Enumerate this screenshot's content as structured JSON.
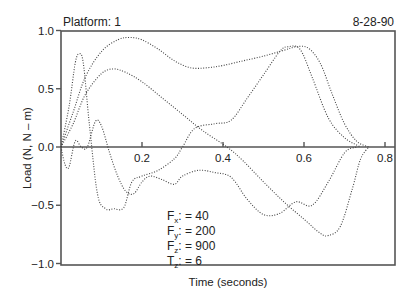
{
  "header": {
    "platform_label": "Platform: 1",
    "date": "8-28-90"
  },
  "annotation": [
    {
      "sym": "F",
      "sub": "x",
      "text": ": = 40"
    },
    {
      "sym": "F",
      "sub": "y",
      "text": ": = 200"
    },
    {
      "sym": "F",
      "sub": "z",
      "text": ": = 900"
    },
    {
      "sym": "T",
      "sub": "z",
      "text": ": = 6"
    }
  ],
  "chart_data": {
    "type": "line",
    "title": "Platform: 1",
    "subtitle": "8-28-90",
    "xlabel": "Time (seconds)",
    "ylabel": "Load (N, N – m)",
    "xlim": [
      0,
      0.82
    ],
    "ylim": [
      -1.0,
      1.0
    ],
    "xticks": [
      0.2,
      0.4,
      0.6,
      0.8
    ],
    "xtick_labels": [
      "0.2",
      "0.4",
      "0.6",
      "0.8"
    ],
    "yticks": [
      1.0,
      0.5,
      0.0,
      -0.5,
      -1.0
    ],
    "ytick_labels": [
      "1.0",
      "0.5",
      "0.0",
      "−0.5",
      "−1.0"
    ],
    "grid": false,
    "line_style": "dotted",
    "legend_position": "inside-lower-center (scale factors)",
    "series": [
      {
        "name": "Fz (scale 900)",
        "x": [
          0.0,
          0.03,
          0.06,
          0.1,
          0.14,
          0.17,
          0.2,
          0.24,
          0.28,
          0.32,
          0.36,
          0.4,
          0.45,
          0.5,
          0.55,
          0.58,
          0.61,
          0.64,
          0.67,
          0.7,
          0.73,
          0.76
        ],
        "y": [
          0.0,
          0.3,
          0.6,
          0.82,
          0.92,
          0.94,
          0.92,
          0.84,
          0.74,
          0.68,
          0.68,
          0.7,
          0.74,
          0.78,
          0.83,
          0.86,
          0.85,
          0.72,
          0.45,
          0.2,
          0.05,
          0.0
        ]
      },
      {
        "name": "Fy (scale 200)",
        "x": [
          0.0,
          0.03,
          0.06,
          0.1,
          0.13,
          0.16,
          0.2,
          0.25,
          0.3,
          0.35,
          0.41,
          0.45,
          0.5,
          0.55,
          0.6,
          0.64,
          0.66,
          0.69,
          0.72,
          0.74,
          0.76
        ],
        "y": [
          0.0,
          0.2,
          0.45,
          0.63,
          0.67,
          0.64,
          0.56,
          0.42,
          0.28,
          0.14,
          0.0,
          -0.12,
          -0.3,
          -0.47,
          -0.62,
          -0.74,
          -0.76,
          -0.68,
          -0.35,
          -0.1,
          0.0
        ]
      },
      {
        "name": "Fx (scale 40)",
        "x": [
          0.0,
          0.02,
          0.035,
          0.045,
          0.055,
          0.07,
          0.09,
          0.11,
          0.13,
          0.155,
          0.175,
          0.2,
          0.24,
          0.28,
          0.3,
          0.33,
          0.38,
          0.42,
          0.46,
          0.5,
          0.54,
          0.56,
          0.59,
          0.62,
          0.66,
          0.7,
          0.74
        ],
        "y": [
          0.0,
          0.35,
          0.72,
          0.8,
          0.72,
          0.2,
          -0.4,
          -0.53,
          -0.53,
          -0.52,
          -0.3,
          -0.25,
          -0.2,
          -0.1,
          0.0,
          0.16,
          0.2,
          0.23,
          0.42,
          0.62,
          0.82,
          0.86,
          0.84,
          0.6,
          0.25,
          0.08,
          0.0
        ]
      },
      {
        "name": "Tz (scale 6)",
        "x": [
          0.0,
          0.01,
          0.02,
          0.035,
          0.05,
          0.065,
          0.085,
          0.1,
          0.12,
          0.14,
          0.16,
          0.18,
          0.2,
          0.22,
          0.25,
          0.28,
          0.3,
          0.34,
          0.38,
          0.42,
          0.46,
          0.5,
          0.54,
          0.58,
          0.62,
          0.66,
          0.7,
          0.73
        ],
        "y": [
          0.0,
          -0.15,
          -0.17,
          0.05,
          0.0,
          0.0,
          0.22,
          0.18,
          -0.05,
          -0.25,
          -0.38,
          -0.4,
          -0.3,
          -0.25,
          -0.28,
          -0.32,
          -0.25,
          -0.2,
          -0.22,
          -0.26,
          -0.45,
          -0.58,
          -0.57,
          -0.47,
          -0.5,
          -0.3,
          -0.05,
          0.0
        ]
      }
    ]
  }
}
